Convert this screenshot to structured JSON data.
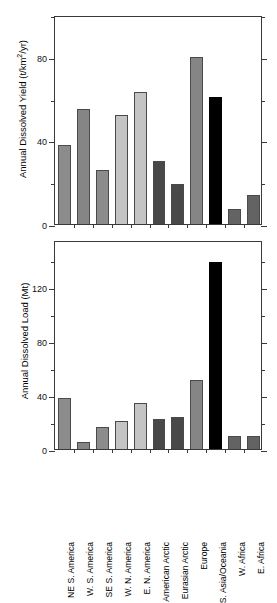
{
  "chart_data": [
    {
      "id": "top",
      "type": "bar",
      "title": "",
      "xlabel": "",
      "ylabel": "Annual Dissolved Yield  (t/km2/yr)",
      "ylabel_plain": "Annual Dissolved Yield (t/km²/yr)",
      "ylabel_prefix": "Annual Dissolved Yield  (t/km",
      "ylabel_exponent": "2",
      "ylabel_suffix": "/yr)",
      "ylim": [
        0,
        100
      ],
      "yticks": [
        0,
        40,
        80
      ],
      "ytick_labels": [
        "0",
        "40",
        "80"
      ],
      "yticks_minor": [
        20,
        60,
        100
      ],
      "grid": false,
      "legend": "none",
      "categories": [
        "NE S. America",
        "W. S. America",
        "SE S. America",
        "W. N. America",
        "E. N. America",
        "American Arctic",
        "Eurasian Arctic",
        "Europe",
        "S. Asia/Oceania",
        "W. Africa",
        "E. Africa"
      ],
      "values": [
        38,
        55,
        26,
        52,
        63,
        30,
        19,
        80,
        61,
        7,
        14
      ],
      "colors": [
        "#8c8c8c",
        "#858585",
        "#8c8c8c",
        "#c4c4c4",
        "#c4c4c4",
        "#484848",
        "#484848",
        "#858585",
        "#000000",
        "#636363",
        "#636363"
      ]
    },
    {
      "id": "bottom",
      "type": "bar",
      "title": "",
      "xlabel": "",
      "ylabel": "Annual Dissolved Load  (Mt)",
      "ylabel_plain": "Annual Dissolved Load (Mt)",
      "ylim": [
        0,
        155
      ],
      "yticks": [
        0,
        40,
        80,
        120
      ],
      "ytick_labels": [
        "0",
        "40",
        "80",
        "120"
      ],
      "yticks_minor": [
        20,
        60,
        100,
        140
      ],
      "grid": false,
      "legend": "none",
      "categories": [
        "NE S. America",
        "W. S. America",
        "SE S. America",
        "W. N. America",
        "E. N. America",
        "American Arctic",
        "Eurasian Arctic",
        "Europe",
        "S. Asia/Oceania",
        "W. Africa",
        "E. Africa"
      ],
      "values": [
        38,
        5,
        16,
        21,
        34,
        22,
        24,
        51,
        139,
        10,
        10
      ],
      "colors": [
        "#8c8c8c",
        "#858585",
        "#8c8c8c",
        "#c4c4c4",
        "#c4c4c4",
        "#484848",
        "#484848",
        "#858585",
        "#000000",
        "#636363",
        "#636363"
      ]
    }
  ],
  "axis_labels": {
    "top_y": "Annual Dissolved Yield  (t/km",
    "top_y_exp": "2",
    "top_y_tail": "/yr)",
    "bottom_y": "Annual Dissolved Load  (Mt)"
  },
  "categories": [
    "NE S. America",
    "W. S. America",
    "SE S. America",
    "W. N. America",
    "E. N. America",
    "American Arctic",
    "Eurasian Arctic",
    "Europe",
    "S. Asia/Oceania",
    "W. Africa",
    "E. Africa"
  ],
  "colors": {
    "axis": "#3a3a3a",
    "bar_outline": "#4a4a4a",
    "background": "#ffffff",
    "text": "#000000"
  }
}
